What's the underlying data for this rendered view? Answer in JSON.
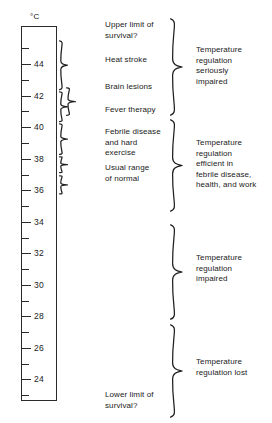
{
  "figure": {
    "unit_label": "°C"
  },
  "scale": {
    "unit": "°C",
    "min": 23,
    "max": 45,
    "major_step": 2,
    "minor_step": 1,
    "major_labels": [
      "44",
      "42",
      "40",
      "38",
      "36",
      "34",
      "32",
      "30",
      "28",
      "26",
      "24"
    ],
    "major_values": [
      44,
      42,
      40,
      38,
      36,
      34,
      32,
      30,
      28,
      26,
      24
    ],
    "minor_values": [
      45,
      43,
      41,
      39,
      37,
      35,
      33,
      31,
      29,
      27,
      25,
      23
    ],
    "direction": "descending"
  },
  "effects": [
    {
      "id": "upper-limit",
      "label": "Upper limit of\nsurvival?",
      "range_c": [
        44.5,
        45.5
      ]
    },
    {
      "id": "heat-stroke",
      "label": "Heat stroke",
      "range_c": [
        42.5,
        44.5
      ]
    },
    {
      "id": "brain-lesions",
      "label": "Brain lesions",
      "range_c": [
        41.5,
        42.8
      ]
    },
    {
      "id": "fever-therapy",
      "label": "Fever therapy",
      "range_c": [
        41.0,
        42.0
      ]
    },
    {
      "id": "febrile-disease",
      "label": "Febrile disease\nand hard\nexercise",
      "range_c": [
        38.0,
        40.5
      ]
    },
    {
      "id": "usual-range",
      "label": "Usual range\nof normal",
      "range_c": [
        36.0,
        38.0
      ]
    },
    {
      "id": "lower-limit",
      "label": "Lower limit of\nsurvival?",
      "range_c": [
        23.5,
        25.0
      ]
    }
  ],
  "regulation_zones": [
    {
      "id": "seriously-impaired",
      "label": "Temperature\nregulation\nseriously\nimpaired",
      "range_c": [
        41.0,
        45.5
      ]
    },
    {
      "id": "efficient",
      "label": "Temperature\nregulation\nefficient in\nfebrile disease,\nhealth, and work",
      "range_c": [
        35.5,
        41.0
      ]
    },
    {
      "id": "impaired",
      "label": "Temperature\nregulation\nimpaired",
      "range_c": [
        29.5,
        35.0
      ]
    },
    {
      "id": "lost",
      "label": "Temperature\nregulation lost",
      "range_c": [
        23.3,
        29.2
      ]
    }
  ],
  "colors": {
    "ink": "#1f1f1f",
    "outline": "#2b2b2b",
    "background": "#ffffff"
  }
}
